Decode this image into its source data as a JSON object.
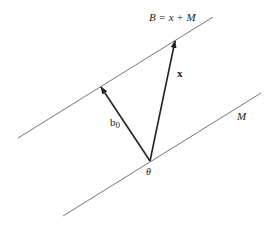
{
  "diagram": {
    "labels": {
      "affine_set": "B = x + M",
      "x_vector": "x",
      "b0_vector": "b",
      "b0_subscript": "0",
      "subspace": "M",
      "origin": "θ"
    },
    "colors": {
      "line": "#777777",
      "arrow": "#222222",
      "text": "#222222"
    }
  }
}
